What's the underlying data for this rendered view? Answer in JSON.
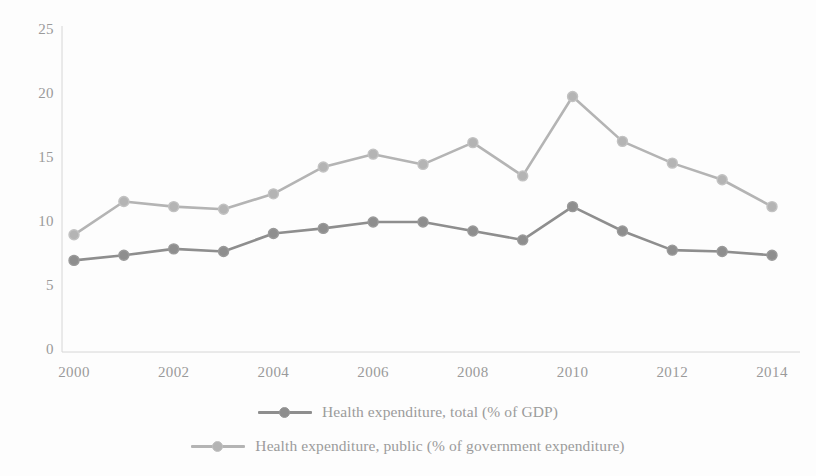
{
  "chart_data": {
    "type": "line",
    "title": "",
    "subtitle": "",
    "xlabel": "",
    "ylabel": "",
    "x": [
      2000,
      2001,
      2002,
      2003,
      2004,
      2005,
      2006,
      2007,
      2008,
      2009,
      2010,
      2011,
      2012,
      2013,
      2014
    ],
    "xtick_labels": [
      "2000",
      "2002",
      "2004",
      "2006",
      "2008",
      "2010",
      "2012",
      "2014"
    ],
    "xtick_values": [
      2000,
      2002,
      2004,
      2006,
      2008,
      2010,
      2012,
      2014
    ],
    "xlim": [
      2000,
      2014
    ],
    "ytick_labels": [
      "0",
      "5",
      "10",
      "15",
      "20",
      "25"
    ],
    "ytick_values": [
      0,
      5,
      10,
      15,
      20,
      25
    ],
    "ylim": [
      0,
      25
    ],
    "grid": false,
    "legend_position": "bottom",
    "series": [
      {
        "name": "Health expenditure, total (% of GDP)",
        "color": "#8e8e8e",
        "marker": "circle",
        "values": [
          7.0,
          7.4,
          7.9,
          7.7,
          9.1,
          9.5,
          10.0,
          10.0,
          9.3,
          8.6,
          11.2,
          9.3,
          7.8,
          7.7,
          7.4
        ]
      },
      {
        "name": "Health expenditure, public (% of government expenditure)",
        "color": "#b4b4b4",
        "marker": "circle",
        "values": [
          9.0,
          11.6,
          11.2,
          11.0,
          12.2,
          14.3,
          15.3,
          14.5,
          16.2,
          13.6,
          19.8,
          16.3,
          14.6,
          13.3,
          11.2
        ]
      }
    ]
  },
  "legend": {
    "items": [
      {
        "label": "Health expenditure, total (% of GDP)"
      },
      {
        "label": "Health expenditure, public (% of government expenditure)"
      }
    ]
  },
  "colors": {
    "total_series": "#8e8e8e",
    "public_series": "#b4b4b4",
    "axis": "#d2d2d2",
    "tick_text": "#9a9a9a",
    "legend_text": "#9b9b9b",
    "background": "#fdfdfd"
  }
}
